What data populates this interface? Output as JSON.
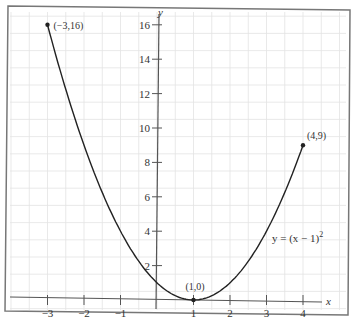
{
  "chart_data": {
    "type": "line",
    "title": "",
    "function_label": "y = (x − 1)",
    "function_exponent": "2",
    "xlabel": "x",
    "ylabel": "y",
    "xlim": [
      -3.5,
      4.6
    ],
    "ylim": [
      -0.5,
      16.8
    ],
    "x_ticks": [
      -3,
      -2,
      -1,
      1,
      2,
      3,
      4
    ],
    "x_tick_labels": [
      "−3",
      "−2",
      "−1",
      "1",
      "2",
      "3",
      "4"
    ],
    "y_ticks": [
      2,
      4,
      6,
      8,
      10,
      12,
      14,
      16
    ],
    "y_tick_labels": [
      "2",
      "4",
      "6",
      "8",
      "10",
      "12",
      "14",
      "16"
    ],
    "grid": true,
    "series": [
      {
        "name": "y = (x − 1)^2",
        "x": [
          -3,
          -2.5,
          -2,
          -1.5,
          -1,
          -0.5,
          0,
          0.5,
          1,
          1.5,
          2,
          2.5,
          3,
          3.5,
          4
        ],
        "y": [
          16,
          12.25,
          9,
          6.25,
          4,
          2.25,
          1,
          0.25,
          0,
          0.25,
          1,
          2.25,
          4,
          6.25,
          9
        ]
      }
    ],
    "annotations": [
      {
        "label": "(−3,16)",
        "x": -3,
        "y": 16
      },
      {
        "label": "(1,0)",
        "x": 1,
        "y": 0
      },
      {
        "label": "(4,9)",
        "x": 4,
        "y": 9
      }
    ]
  }
}
